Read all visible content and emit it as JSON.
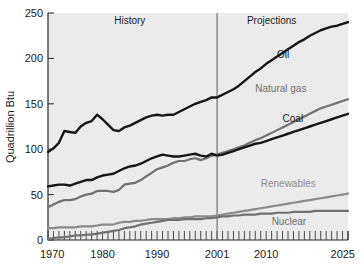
{
  "chart_data": {
    "type": "line",
    "title": "",
    "xlabel": "",
    "ylabel": "Quadrillion Btu",
    "xlim": [
      1970,
      2025
    ],
    "ylim": [
      0,
      250
    ],
    "yticks": [
      0,
      50,
      100,
      150,
      200,
      250
    ],
    "ytick_labels": [
      "0",
      "50",
      "100",
      "150",
      "200",
      "250"
    ],
    "xticks": [
      1970,
      1980,
      1990,
      2001,
      2010,
      2025
    ],
    "xtick_labels": [
      "1970",
      "1980",
      "1990",
      "2001",
      "2010",
      "2025"
    ],
    "minor_xtick_interval": 1,
    "grid": false,
    "legend_position": "inline-annotations",
    "plot_background": "#ebebeb",
    "annotations": [
      {
        "text": "History",
        "x": 1985,
        "y": 238,
        "name": "history-label"
      },
      {
        "text": "Projections",
        "x": 2011,
        "y": 238,
        "name": "projections-label"
      }
    ],
    "divider": {
      "x": 2001,
      "label": "2001",
      "color": "#666666"
    },
    "series": [
      {
        "name": "Oil",
        "color": "#151515",
        "width": 2.4,
        "label_x": 2012,
        "label_y": 200,
        "x": [
          1970,
          1971,
          1972,
          1973,
          1974,
          1975,
          1976,
          1977,
          1978,
          1979,
          1980,
          1981,
          1982,
          1983,
          1984,
          1985,
          1986,
          1987,
          1988,
          1989,
          1990,
          1991,
          1992,
          1993,
          1994,
          1995,
          1996,
          1997,
          1998,
          1999,
          2000,
          2001,
          2002,
          2003,
          2004,
          2005,
          2006,
          2007,
          2008,
          2009,
          2010,
          2011,
          2012,
          2013,
          2014,
          2015,
          2016,
          2017,
          2018,
          2019,
          2020,
          2021,
          2022,
          2023,
          2024,
          2025
        ],
        "y": [
          97,
          101,
          107,
          120,
          119,
          118,
          125,
          129,
          131,
          138,
          133,
          127,
          121,
          120,
          124,
          126,
          129,
          132,
          135,
          137,
          138,
          137,
          138,
          138,
          141,
          144,
          147,
          150,
          152,
          154,
          157,
          157,
          160,
          163,
          166,
          170,
          175,
          180,
          185,
          189,
          194,
          198,
          202,
          206,
          210,
          214,
          218,
          221,
          225,
          228,
          231,
          233,
          235,
          236,
          238,
          240
        ]
      },
      {
        "name": "Natural gas",
        "color": "#707070",
        "width": 2.2,
        "label_x": 2008,
        "label_y": 163,
        "x": [
          1970,
          1971,
          1972,
          1973,
          1974,
          1975,
          1976,
          1977,
          1978,
          1979,
          1980,
          1981,
          1982,
          1983,
          1984,
          1985,
          1986,
          1987,
          1988,
          1989,
          1990,
          1991,
          1992,
          1993,
          1994,
          1995,
          1996,
          1997,
          1998,
          1999,
          2000,
          2001,
          2002,
          2003,
          2004,
          2005,
          2006,
          2007,
          2008,
          2009,
          2010,
          2011,
          2012,
          2013,
          2014,
          2015,
          2016,
          2017,
          2018,
          2019,
          2020,
          2021,
          2022,
          2023,
          2024,
          2025
        ],
        "y": [
          36,
          39,
          42,
          44,
          44,
          45,
          48,
          50,
          51,
          54,
          54,
          54,
          53,
          55,
          61,
          62,
          63,
          66,
          70,
          74,
          78,
          80,
          82,
          85,
          87,
          87,
          89,
          90,
          88,
          90,
          93,
          94,
          96,
          98,
          100,
          102,
          104,
          107,
          110,
          112,
          115,
          118,
          121,
          124,
          127,
          130,
          133,
          136,
          139,
          142,
          145,
          147,
          149,
          151,
          153,
          155
        ]
      },
      {
        "name": "Coal",
        "color": "#151515",
        "width": 2.4,
        "label_x": 2013,
        "label_y": 130,
        "x": [
          1970,
          1971,
          1972,
          1973,
          1974,
          1975,
          1976,
          1977,
          1978,
          1979,
          1980,
          1981,
          1982,
          1983,
          1984,
          1985,
          1986,
          1987,
          1988,
          1989,
          1990,
          1991,
          1992,
          1993,
          1994,
          1995,
          1996,
          1997,
          1998,
          1999,
          2000,
          2001,
          2002,
          2003,
          2004,
          2005,
          2006,
          2007,
          2008,
          2009,
          2010,
          2011,
          2012,
          2013,
          2014,
          2015,
          2016,
          2017,
          2018,
          2019,
          2020,
          2021,
          2022,
          2023,
          2024,
          2025
        ],
        "y": [
          59,
          60,
          61,
          61,
          60,
          62,
          64,
          66,
          66,
          69,
          71,
          72,
          73,
          76,
          79,
          81,
          82,
          84,
          87,
          90,
          92,
          94,
          93,
          92,
          92,
          93,
          94,
          95,
          93,
          92,
          95,
          93,
          94,
          96,
          98,
          100,
          102,
          104,
          106,
          107,
          109,
          111,
          113,
          115,
          117,
          119,
          121,
          123,
          125,
          127,
          129,
          131,
          133,
          135,
          137,
          139
        ]
      },
      {
        "name": "Renewables",
        "color": "#8c8c8c",
        "width": 2.2,
        "label_x": 2009,
        "label_y": 58,
        "x": [
          1970,
          1971,
          1972,
          1973,
          1974,
          1975,
          1976,
          1977,
          1978,
          1979,
          1980,
          1981,
          1982,
          1983,
          1984,
          1985,
          1986,
          1987,
          1988,
          1989,
          1990,
          1991,
          1992,
          1993,
          1994,
          1995,
          1996,
          1997,
          1998,
          1999,
          2000,
          2001,
          2002,
          2003,
          2004,
          2005,
          2006,
          2007,
          2008,
          2009,
          2010,
          2011,
          2012,
          2013,
          2014,
          2015,
          2016,
          2017,
          2018,
          2019,
          2020,
          2021,
          2022,
          2023,
          2024,
          2025
        ],
        "y": [
          13,
          13,
          14,
          14,
          14,
          14,
          15,
          15,
          15,
          16,
          17,
          17,
          17,
          19,
          20,
          20,
          21,
          21,
          22,
          23,
          23,
          23,
          23,
          24,
          24,
          25,
          25,
          26,
          26,
          26,
          26,
          27,
          28,
          29,
          30,
          31,
          32,
          33,
          34,
          35,
          36,
          37,
          38,
          39,
          40,
          41,
          42,
          43,
          44,
          45,
          46,
          47,
          48,
          49,
          50,
          51
        ]
      },
      {
        "name": "Nuclear",
        "color": "#707070",
        "width": 2.2,
        "label_x": 2011,
        "label_y": 16,
        "x": [
          1970,
          1971,
          1972,
          1973,
          1974,
          1975,
          1976,
          1977,
          1978,
          1979,
          1980,
          1981,
          1982,
          1983,
          1984,
          1985,
          1986,
          1987,
          1988,
          1989,
          1990,
          1991,
          1992,
          1993,
          1994,
          1995,
          1996,
          1997,
          1998,
          1999,
          2000,
          2001,
          2002,
          2003,
          2004,
          2005,
          2006,
          2007,
          2008,
          2009,
          2010,
          2011,
          2012,
          2013,
          2014,
          2015,
          2016,
          2017,
          2018,
          2019,
          2020,
          2021,
          2022,
          2023,
          2024,
          2025
        ],
        "y": [
          1,
          2,
          3,
          3,
          4,
          5,
          5,
          6,
          6,
          7,
          8,
          9,
          10,
          11,
          13,
          14,
          15,
          17,
          18,
          19,
          20,
          21,
          22,
          22,
          22,
          23,
          23,
          23,
          23,
          24,
          24,
          25,
          26,
          26,
          27,
          27,
          28,
          28,
          28,
          29,
          29,
          29,
          30,
          30,
          30,
          31,
          31,
          31,
          31,
          32,
          32,
          32,
          32,
          32,
          32,
          32
        ]
      }
    ]
  }
}
